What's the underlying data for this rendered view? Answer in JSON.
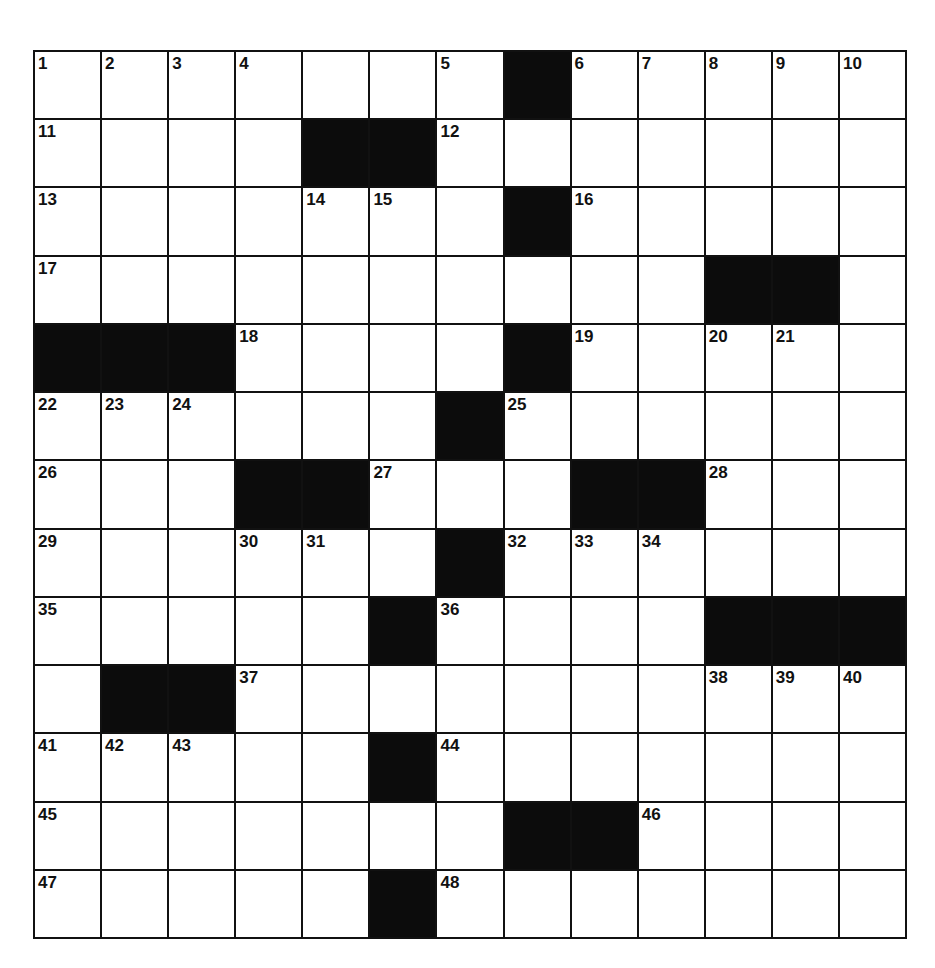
{
  "puzzle": {
    "rows": 13,
    "cols": 13,
    "colors": {
      "block": "#0c0c0c",
      "cell": "#ffffff",
      "line": "#111111"
    },
    "layout": [
      "1,2,3,4,.,.,5,#,6,7,8,9,10",
      "11,.,.,.,#,#,12,.,.,.,.,.,.",
      "13,.,.,.,14,15,.,#,16,.,.,.,.",
      "17,.,.,.,.,.,.,.,.,.,#,#,.",
      "#,#,#,18,.,.,.,#,19,.,20,21,.",
      "22,23,24,.,.,.,#,25,.,.,.,.,.",
      "26,.,.,#,#,27,.,.,#,#,28,.,.",
      "29,.,.,30,31,.,#,32,33,34,.,.,.",
      "35,.,.,.,.,#,36,.,.,.,#,#,#",
      ".,#,#,37,.,.,.,.,.,.,38,39,40",
      "41,42,43,.,.,#,44,.,.,.,.,.,.",
      "45,.,.,.,.,.,.,#,#,46,.,.,.",
      "47,.,.,.,.,#,48,.,.,.,.,.,."
    ]
  }
}
